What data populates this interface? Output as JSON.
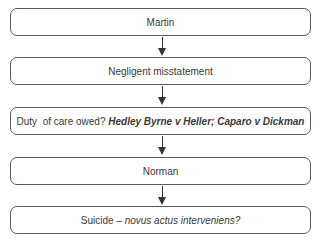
{
  "diagram": {
    "type": "flowchart",
    "direction": "top-to-bottom",
    "nodes": [
      {
        "id": "martin",
        "text": "Martin"
      },
      {
        "id": "negligent",
        "text": "Negligent misstatement"
      },
      {
        "id": "duty",
        "text_plain": "Duty  of care owed? ",
        "text_case": "Hedley Byrne v Heller; Caparo v Dickman"
      },
      {
        "id": "norman",
        "text": "Norman"
      },
      {
        "id": "suicide",
        "text_plain": "Suicide – ",
        "text_italic": "novus actus interveniens?"
      }
    ],
    "edges": [
      {
        "from": "martin",
        "to": "negligent"
      },
      {
        "from": "negligent",
        "to": "duty"
      },
      {
        "from": "duty",
        "to": "norman"
      },
      {
        "from": "norman",
        "to": "suicide"
      }
    ],
    "colors": {
      "border": "#5a5a5a",
      "arrow": "#333333",
      "text": "#3a3a3a"
    }
  }
}
